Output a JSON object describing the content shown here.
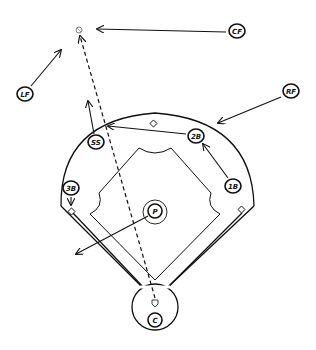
{
  "diagram": {
    "type": "baseball-field-play-diagram",
    "colors": {
      "ink": "#111111",
      "background": "#ffffff"
    },
    "players": [
      {
        "id": "CF",
        "label": "CF",
        "x": 237,
        "y": 31
      },
      {
        "id": "LF",
        "label": "LF",
        "x": 25,
        "y": 94
      },
      {
        "id": "RF",
        "label": "RF",
        "x": 291,
        "y": 91
      },
      {
        "id": "SS",
        "label": "SS",
        "x": 96,
        "y": 141
      },
      {
        "id": "2B",
        "label": "2B",
        "x": 196,
        "y": 137
      },
      {
        "id": "1B",
        "label": "1B",
        "x": 233,
        "y": 186
      },
      {
        "id": "3B",
        "label": "3B",
        "x": 71,
        "y": 188
      },
      {
        "id": "P",
        "label": "P",
        "x": 155,
        "y": 212
      },
      {
        "id": "C",
        "label": "C",
        "x": 155,
        "y": 320
      }
    ],
    "ball_marker": {
      "label": "ball",
      "x": 79,
      "y": 30
    },
    "home_marker": {
      "label": "home",
      "x": 155,
      "y": 305
    },
    "movements": [
      {
        "from": "CF",
        "desc": "CF moves left toward ball"
      },
      {
        "from": "LF",
        "desc": "LF moves up-right toward ball"
      },
      {
        "from": "RF",
        "desc": "RF moves in toward infield arc"
      },
      {
        "from": "SS",
        "desc": "SS moves out to shallow outfield"
      },
      {
        "from": "2B",
        "desc": "2B moves to edge of grass near SS"
      },
      {
        "from": "1B",
        "desc": "1B moves toward 2B"
      },
      {
        "from": "3B",
        "desc": "3B moves toward third base bag"
      },
      {
        "from": "P",
        "desc": "P moves toward third-base side foul line"
      }
    ],
    "ball_path": {
      "style": "dashed",
      "from": "home",
      "to": "ball"
    }
  }
}
